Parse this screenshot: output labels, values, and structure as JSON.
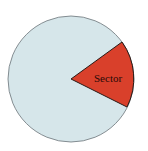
{
  "diagram": {
    "type": "circle-sector",
    "circle": {
      "cx": 71,
      "cy": 79,
      "r": 63,
      "fill": "#d6e6ea",
      "stroke": "#6b7378"
    },
    "sector": {
      "label": "Sector",
      "fill": "#d9402b",
      "stroke": "#2a1a16",
      "start_point": [
        122,
        42
      ],
      "end_point": [
        127,
        107
      ]
    }
  }
}
